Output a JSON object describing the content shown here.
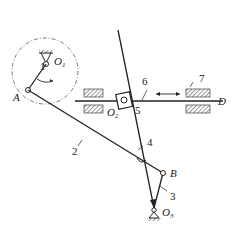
{
  "diagram": {
    "type": "linkage-mechanism",
    "labels": {
      "A": "A",
      "B": "B",
      "D": "D",
      "O1": "O",
      "O1_sub": "1",
      "O2": "O",
      "O2_sub": "2",
      "O3": "O",
      "O3_sub": "3",
      "n1": "1",
      "n2": "2",
      "n3": "3",
      "n4": "4",
      "n5": "5",
      "n6": "6",
      "n7": "7"
    },
    "colors": {
      "line": "#222222",
      "circle": "#555555"
    }
  }
}
